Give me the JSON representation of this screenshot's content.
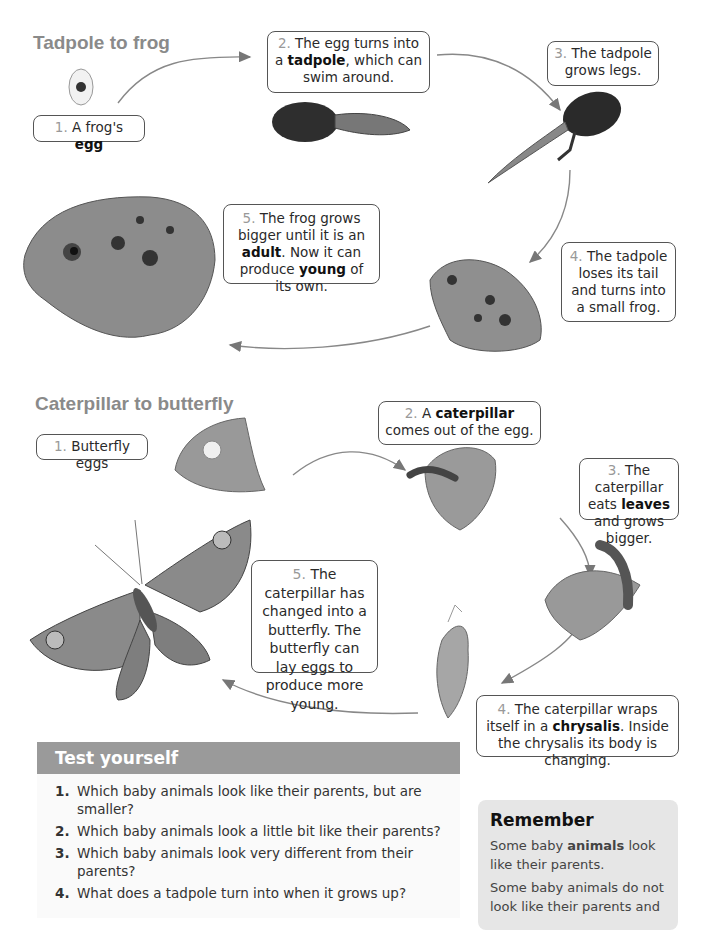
{
  "frog_section": {
    "title": "Tadpole to frog",
    "steps": [
      {
        "num": "1.",
        "before": "A frog's ",
        "bold": "egg",
        "after": ""
      },
      {
        "num": "2.",
        "before": "The egg turns into a ",
        "bold": "tadpole",
        "after": ", which can swim around."
      },
      {
        "num": "3.",
        "before": "The tadpole grows legs.",
        "bold": "",
        "after": ""
      },
      {
        "num": "4.",
        "before": "The tadpole loses its tail and turns into a small frog.",
        "bold": "",
        "after": ""
      },
      {
        "num": "5.",
        "before": "The frog grows bigger until it is an ",
        "bold": "adult",
        "after": ". Now it can produce ",
        "bold2": "young",
        "after2": " of its own."
      }
    ],
    "illustrations": [
      "frog-egg",
      "tadpole",
      "tadpole-with-legs",
      "small-frog",
      "adult-frog"
    ]
  },
  "butterfly_section": {
    "title": "Caterpillar to butterfly",
    "steps": [
      {
        "num": "1.",
        "before": "Butterfly eggs",
        "bold": "",
        "after": ""
      },
      {
        "num": "2.",
        "before": "A ",
        "bold": "caterpillar",
        "after": " comes out of the egg."
      },
      {
        "num": "3.",
        "before": "The caterpillar eats ",
        "bold": "leaves",
        "after": " and grows bigger."
      },
      {
        "num": "4.",
        "before": "The caterpillar wraps itself in a ",
        "bold": "chrysalis",
        "after": ". Inside the chrysalis its body is changing."
      },
      {
        "num": "5.",
        "before": "The caterpillar has changed into a butterfly. The butterfly can lay eggs to produce more young.",
        "bold": "",
        "after": ""
      }
    ],
    "illustrations": [
      "leaf-with-eggs",
      "caterpillar-hatching",
      "caterpillar-on-leaf",
      "chrysalis",
      "butterfly"
    ]
  },
  "test_yourself": {
    "title": "Test yourself",
    "questions": [
      {
        "n": "1.",
        "text": "Which baby animals look like their parents, but are smaller?"
      },
      {
        "n": "2.",
        "text": "Which baby animals look a little bit like their parents?"
      },
      {
        "n": "3.",
        "text": "Which baby animals look very different from their parents?"
      },
      {
        "n": "4.",
        "text": "What does a tadpole turn into when it grows up?"
      }
    ]
  },
  "remember": {
    "title": "Remember",
    "p1_before": "Some baby ",
    "p1_bold": "animals",
    "p1_after": " look like their parents.",
    "p2": "Some baby animals do not look like their parents and"
  },
  "colors": {
    "section_title": "#8a8a8a",
    "test_header": "#9a9a9a",
    "remember_bg": "#e6e6e6",
    "callout_border": "#555555"
  }
}
